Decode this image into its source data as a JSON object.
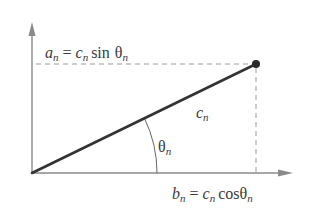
{
  "diagram": {
    "colors": {
      "axis": "#8a8a8a",
      "vector": "#333333",
      "dashed": "#9a9a9a",
      "text": "#3a3a3a",
      "point": "#2b2b2b"
    },
    "labels": {
      "a_n": {
        "var": "a",
        "sub": "n",
        "eq": "=",
        "c": "c",
        "csub": "n",
        "fn": "sin",
        "theta": "θ",
        "tsub": "n"
      },
      "b_n": {
        "var": "b",
        "sub": "n",
        "eq": "=",
        "c": "c",
        "csub": "n",
        "fn": "cos",
        "theta": "θ",
        "tsub": "n"
      },
      "c_n": {
        "var": "c",
        "sub": "n"
      },
      "theta_n": {
        "var": "θ",
        "sub": "n"
      }
    },
    "geometry": {
      "origin": [
        32,
        173
      ],
      "point": [
        256,
        64
      ],
      "x_axis_end": [
        292,
        173
      ],
      "y_axis_end": [
        32,
        24
      ],
      "arc_radius": 125
    }
  }
}
